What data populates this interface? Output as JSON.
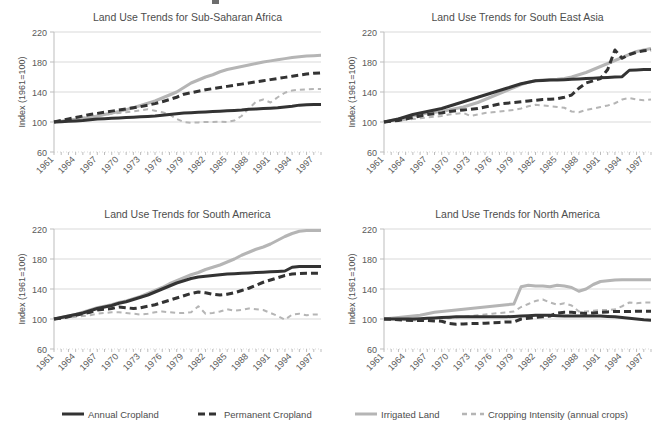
{
  "figure": {
    "width": 661,
    "height": 436,
    "background": "#ffffff"
  },
  "series_style": {
    "annual_cropland": {
      "key": "annual_cropland",
      "label": "Annual Cropland",
      "color": "#333333",
      "width": 3.0,
      "dash": "none"
    },
    "permanent_cropland": {
      "key": "permanent_cropland",
      "label": "Permanent  Cropland",
      "color": "#333333",
      "width": 3.0,
      "dash": "7,4"
    },
    "irrigated_land": {
      "key": "irrigated_land",
      "label": "Irrigated Land",
      "color": "#b5b5b5",
      "width": 3.0,
      "dash": "none"
    },
    "cropping_intensity": {
      "key": "cropping_intensity",
      "label": "Cropping Intensity (annual crops)",
      "color": "#b5b5b5",
      "width": 2.0,
      "dash": "5,4"
    }
  },
  "legend": {
    "items": [
      {
        "key": "annual_cropland",
        "label": "Annual Cropland",
        "color": "#333333",
        "dash": "none",
        "width": 3.0,
        "x": 62,
        "text_x": 88
      },
      {
        "key": "permanent_cropland",
        "label": "Permanent  Cropland",
        "color": "#333333",
        "dash": "7,4",
        "width": 3.0,
        "x": 198,
        "text_x": 224
      },
      {
        "key": "irrigated_land",
        "label": "Irrigated Land",
        "color": "#b5b5b5",
        "dash": "none",
        "width": 3.0,
        "x": 355,
        "text_x": 381
      },
      {
        "key": "cropping_intensity",
        "label": "Cropping Intensity (annual crops)",
        "color": "#b5b5b5",
        "dash": "5,4",
        "width": 2.5,
        "x": 462,
        "text_x": 488
      }
    ],
    "line_length": 22,
    "y": 414
  },
  "chart_data": [
    {
      "type": "line",
      "id": "sub-saharan-africa",
      "title": "Land Use Trends for Sub-Saharan Africa",
      "xlabel": "",
      "ylabel": "Index (1961=100)",
      "x": [
        1961,
        1962,
        1963,
        1964,
        1965,
        1966,
        1967,
        1968,
        1969,
        1970,
        1971,
        1972,
        1973,
        1974,
        1975,
        1976,
        1977,
        1978,
        1979,
        1980,
        1981,
        1982,
        1983,
        1984,
        1985,
        1986,
        1987,
        1988,
        1989,
        1990,
        1991,
        1992,
        1993,
        1994,
        1995,
        1996,
        1997,
        1998
      ],
      "xlim": [
        1961,
        1998
      ],
      "ylim": [
        60,
        220
      ],
      "yticks": [
        60,
        100,
        140,
        180,
        220
      ],
      "xticks": [
        1961,
        1964,
        1967,
        1970,
        1973,
        1976,
        1979,
        1982,
        1985,
        1988,
        1991,
        1994,
        1997
      ],
      "grid": true,
      "legend_position": "figure-bottom",
      "series": [
        {
          "name": "Annual Cropland",
          "key": "annual_cropland",
          "values": [
            100,
            100.5,
            101,
            101.5,
            102,
            103,
            104,
            104.5,
            105,
            105.5,
            106,
            106.5,
            107,
            107.5,
            108,
            109,
            110,
            111,
            112,
            112.5,
            113,
            113.5,
            114,
            114.5,
            115,
            115.5,
            116,
            117,
            117.5,
            118,
            118.5,
            119,
            120,
            121,
            122.5,
            123,
            123.5,
            123.5
          ]
        },
        {
          "name": "Permanent  Cropland",
          "key": "permanent_cropland",
          "values": [
            100,
            102,
            104,
            106,
            108,
            110,
            111.5,
            113,
            114.5,
            116,
            117.5,
            119,
            120.5,
            122.5,
            124.5,
            127,
            130,
            133,
            137,
            139,
            141,
            143,
            144.5,
            146,
            147.5,
            149,
            150.5,
            152,
            153.5,
            155,
            156.5,
            158,
            159.5,
            161,
            162.5,
            164,
            165,
            165.5
          ]
        },
        {
          "name": "Irrigated Land",
          "key": "irrigated_land",
          "values": [
            100,
            101,
            102,
            103,
            104.5,
            106,
            108,
            110,
            112,
            114,
            116.5,
            119,
            122,
            125,
            128,
            132,
            136,
            140,
            146,
            152,
            156,
            160,
            163,
            167,
            170,
            172,
            174,
            176,
            178,
            180,
            181.5,
            183,
            184.5,
            186,
            187,
            188,
            188.5,
            189
          ]
        },
        {
          "name": "Cropping Intensity (annual crops)",
          "key": "cropping_intensity",
          "values": [
            100,
            101.5,
            103,
            104.5,
            106,
            107,
            108,
            109.5,
            111,
            112,
            113,
            114,
            115.5,
            117,
            115,
            113,
            110,
            104,
            100,
            99,
            99.5,
            100,
            100,
            100.5,
            100,
            102,
            108,
            118,
            127,
            130,
            126,
            133,
            139,
            142,
            143,
            143.5,
            144,
            144
          ]
        }
      ]
    },
    {
      "type": "line",
      "id": "south-east-asia",
      "title": "Land Use Trends for South East Asia",
      "xlabel": "",
      "ylabel": "Index (1961=100)",
      "x": [
        1961,
        1962,
        1963,
        1964,
        1965,
        1966,
        1967,
        1968,
        1969,
        1970,
        1971,
        1972,
        1973,
        1974,
        1975,
        1976,
        1977,
        1978,
        1979,
        1980,
        1981,
        1982,
        1983,
        1984,
        1985,
        1986,
        1987,
        1988,
        1989,
        1990,
        1991,
        1992,
        1993,
        1994,
        1995,
        1996,
        1997,
        1998
      ],
      "xlim": [
        1961,
        1998
      ],
      "ylim": [
        60,
        220
      ],
      "yticks": [
        60,
        100,
        140,
        180,
        220
      ],
      "xticks": [
        1961,
        1964,
        1967,
        1970,
        1973,
        1976,
        1979,
        1982,
        1985,
        1988,
        1991,
        1994,
        1997
      ],
      "grid": true,
      "legend_position": "figure-bottom",
      "series": [
        {
          "name": "Annual Cropland",
          "key": "annual_cropland",
          "values": [
            100,
            102,
            104,
            107,
            110,
            112,
            114,
            116,
            118,
            121,
            124,
            127,
            130,
            133,
            136,
            139,
            142,
            145,
            148,
            151,
            153,
            155,
            155.5,
            156,
            156,
            156.5,
            157,
            157.5,
            158,
            158.5,
            159,
            159.5,
            160,
            160.5,
            169,
            169.5,
            170,
            170
          ]
        },
        {
          "name": "Permanent  Cropland",
          "key": "permanent_cropland",
          "values": [
            100,
            101,
            102,
            104,
            106,
            108,
            110,
            111,
            112,
            114,
            115,
            116,
            117,
            118,
            120,
            122,
            124,
            125,
            126,
            127,
            128,
            129,
            130,
            130.5,
            131,
            133,
            136,
            145,
            152,
            155,
            158,
            170,
            196,
            185,
            190,
            193,
            195,
            196
          ]
        },
        {
          "name": "Irrigated Land",
          "key": "irrigated_land",
          "values": [
            100,
            102,
            104,
            106,
            108,
            110,
            112,
            113,
            114,
            116,
            118,
            120,
            123,
            126,
            130,
            134,
            138,
            142,
            146,
            150,
            153,
            155,
            156,
            156.5,
            157,
            158,
            160,
            163,
            166,
            170,
            174,
            178,
            182,
            186,
            190,
            194,
            196,
            198
          ]
        },
        {
          "name": "Cropping Intensity (annual crops)",
          "key": "cropping_intensity",
          "values": [
            100,
            101,
            102,
            103,
            104,
            105,
            106,
            107,
            108,
            110,
            111,
            112,
            108,
            110,
            112,
            113,
            114,
            115,
            116,
            118,
            121,
            123,
            122,
            121,
            120,
            119,
            114,
            113,
            116,
            118,
            120,
            122,
            125,
            130,
            132,
            130,
            129,
            130
          ]
        }
      ]
    },
    {
      "type": "line",
      "id": "south-america",
      "title": "Land Use Trends for South America",
      "xlabel": "",
      "ylabel": "Index (1961=100)",
      "x": [
        1961,
        1962,
        1963,
        1964,
        1965,
        1966,
        1967,
        1968,
        1969,
        1970,
        1971,
        1972,
        1973,
        1974,
        1975,
        1976,
        1977,
        1978,
        1979,
        1980,
        1981,
        1982,
        1983,
        1984,
        1985,
        1986,
        1987,
        1988,
        1989,
        1990,
        1991,
        1992,
        1993,
        1994,
        1995,
        1996,
        1997,
        1998
      ],
      "xlim": [
        1961,
        1998
      ],
      "ylim": [
        60,
        220
      ],
      "yticks": [
        60,
        100,
        140,
        180,
        220
      ],
      "xticks": [
        1961,
        1964,
        1967,
        1970,
        1973,
        1976,
        1979,
        1982,
        1985,
        1988,
        1991,
        1994,
        1997
      ],
      "grid": true,
      "legend_position": "figure-bottom",
      "series": [
        {
          "name": "Annual Cropland",
          "key": "annual_cropland",
          "values": [
            100,
            102,
            104,
            106,
            108,
            111,
            114,
            116,
            118,
            121,
            123,
            126,
            129,
            132,
            136,
            140,
            144,
            148,
            151,
            154,
            156,
            157,
            158,
            159,
            160,
            160.5,
            161,
            161.5,
            162,
            162.5,
            163,
            163.5,
            164,
            169,
            170,
            170,
            170,
            170
          ]
        },
        {
          "name": "Permanent  Cropland",
          "key": "permanent_cropland",
          "values": [
            100,
            101,
            103,
            105,
            107,
            109,
            112,
            113,
            114,
            116,
            115,
            114,
            115,
            117,
            119,
            122,
            125,
            128,
            131,
            134,
            136,
            135,
            133,
            132,
            133,
            135,
            138,
            141,
            145,
            149,
            152,
            155,
            158,
            160,
            160.5,
            161,
            161,
            161
          ]
        },
        {
          "name": "Irrigated Land",
          "key": "irrigated_land",
          "values": [
            100,
            102,
            104,
            106,
            109,
            112,
            115,
            117,
            119,
            122,
            124,
            127,
            130,
            134,
            138,
            142,
            147,
            151,
            155,
            159,
            162,
            166,
            169,
            172,
            176,
            180,
            185,
            189,
            193,
            196,
            200,
            205,
            210,
            214,
            217,
            218,
            218,
            218
          ]
        },
        {
          "name": "Cropping Intensity (annual crops)",
          "key": "cropping_intensity",
          "values": [
            100,
            101,
            102,
            103,
            104,
            105,
            107,
            108,
            109,
            109,
            108,
            107,
            106,
            107,
            109,
            110,
            109,
            108,
            108,
            109,
            117,
            107,
            108,
            110,
            113,
            111,
            112,
            114,
            113,
            112,
            108,
            104,
            99,
            106,
            107,
            105,
            106,
            106
          ]
        }
      ]
    },
    {
      "type": "line",
      "id": "north-america",
      "title": "Land Use Trends for North America",
      "xlabel": "",
      "ylabel": "Index (1961=100)",
      "x": [
        1961,
        1962,
        1963,
        1964,
        1965,
        1966,
        1967,
        1968,
        1969,
        1970,
        1971,
        1972,
        1973,
        1974,
        1975,
        1976,
        1977,
        1978,
        1979,
        1980,
        1981,
        1982,
        1983,
        1984,
        1985,
        1986,
        1987,
        1988,
        1989,
        1990,
        1991,
        1992,
        1993,
        1994,
        1995,
        1996,
        1997,
        1998
      ],
      "xlim": [
        1961,
        1998
      ],
      "ylim": [
        60,
        220
      ],
      "yticks": [
        60,
        100,
        140,
        180,
        220
      ],
      "xticks": [
        1961,
        1964,
        1967,
        1970,
        1973,
        1976,
        1979,
        1982,
        1985,
        1988,
        1991,
        1994,
        1997
      ],
      "grid": true,
      "legend_position": "figure-bottom",
      "series": [
        {
          "name": "Annual Cropland",
          "key": "annual_cropland",
          "values": [
            100,
            100,
            100,
            100,
            100,
            100.5,
            101,
            101.5,
            102,
            102.5,
            103,
            103,
            103,
            103,
            103,
            103,
            103,
            103,
            103.5,
            104,
            104.5,
            105,
            105,
            105,
            104.5,
            104,
            104,
            104,
            104,
            104,
            104,
            103.5,
            103,
            102,
            101,
            100,
            99,
            98.5
          ]
        },
        {
          "name": "Permanent  Cropland",
          "key": "permanent_cropland",
          "values": [
            100,
            99.5,
            99,
            98.5,
            98,
            98,
            98,
            97.5,
            97,
            94,
            93,
            93.5,
            94,
            94,
            94.5,
            95,
            95.5,
            96,
            96,
            100,
            101,
            102,
            103,
            104,
            108,
            109,
            109,
            108,
            107.5,
            108,
            109,
            109.5,
            110,
            110,
            110,
            110.5,
            110.5,
            110.5
          ]
        },
        {
          "name": "Irrigated Land",
          "key": "irrigated_land",
          "values": [
            100,
            101,
            102,
            103,
            104,
            105,
            107,
            109,
            110,
            111,
            112,
            113,
            114,
            115,
            116,
            117,
            118,
            119,
            120,
            143,
            145,
            144,
            144,
            143,
            145,
            144,
            142,
            137,
            140,
            146,
            150,
            151,
            152,
            152.5,
            152.5,
            152.5,
            152.5,
            152.5
          ]
        },
        {
          "name": "Cropping Intensity (annual crops)",
          "key": "cropping_intensity",
          "values": [
            100,
            101,
            100,
            99,
            98,
            99,
            100,
            101,
            102,
            101,
            102,
            103,
            104,
            105,
            106,
            107,
            108,
            109,
            110,
            116,
            120,
            124,
            126,
            122,
            119,
            121,
            118,
            110,
            110,
            111,
            112,
            112,
            113,
            117,
            122,
            121,
            122,
            122
          ]
        }
      ]
    }
  ],
  "panels_layout": [
    {
      "id": "sub-saharan-africa",
      "x": 14,
      "y": 10,
      "w": 317,
      "h": 190
    },
    {
      "id": "south-east-asia",
      "x": 344,
      "y": 10,
      "w": 317,
      "h": 190
    },
    {
      "id": "south-america",
      "x": 14,
      "y": 207,
      "w": 317,
      "h": 190
    },
    {
      "id": "north-america",
      "x": 344,
      "y": 207,
      "w": 317,
      "h": 190
    }
  ],
  "stray_marks": [
    {
      "name": "top-clipped-mark",
      "x": 212,
      "y": 0,
      "w": 7,
      "h": 4
    }
  ]
}
